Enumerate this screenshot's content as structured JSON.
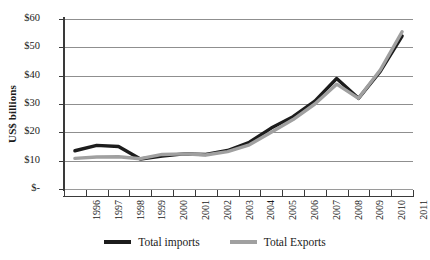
{
  "chart_data": {
    "type": "line",
    "title": "",
    "xlabel": "",
    "ylabel": "US$ billions",
    "categories": [
      "1996",
      "1997",
      "1998",
      "1999",
      "2000",
      "2001",
      "2002",
      "2003",
      "2004",
      "2005",
      "2006",
      "2007",
      "2008",
      "2009",
      "2010",
      "2011"
    ],
    "ylim": [
      0,
      60
    ],
    "ytick_values": [
      0,
      10,
      20,
      30,
      40,
      50,
      60
    ],
    "ytick_labels": [
      "$-",
      "$10",
      "$20",
      "$30",
      "$40",
      "$50",
      "$60"
    ],
    "grid": "horizontal",
    "legend_position": "bottom",
    "series": [
      {
        "name": "Total imports",
        "color": "#1c1c1c",
        "width": 3.4,
        "values": [
          13.5,
          15.4,
          15.0,
          10.6,
          11.6,
          12.4,
          12.2,
          13.6,
          16.5,
          21.5,
          25.5,
          31.0,
          39.0,
          32.0,
          41.5,
          54.0
        ]
      },
      {
        "name": "Total Exports",
        "color": "#a0a0a0",
        "width": 3.4,
        "values": [
          10.8,
          11.3,
          11.4,
          10.7,
          12.2,
          12.4,
          12.0,
          13.2,
          15.6,
          20.0,
          24.5,
          30.0,
          37.0,
          32.0,
          42.0,
          55.5
        ]
      }
    ]
  },
  "legend": {
    "entries": [
      {
        "label": "Total imports",
        "color": "#1c1c1c"
      },
      {
        "label": "Total Exports",
        "color": "#a0a0a0"
      }
    ]
  },
  "axis": {
    "y_title": "US$ billions"
  }
}
